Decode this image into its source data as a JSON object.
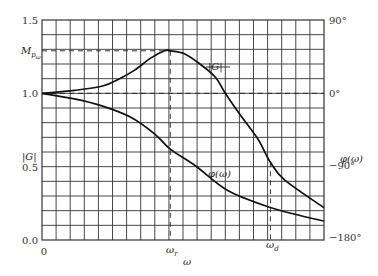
{
  "chart_data": {
    "type": "line",
    "title": "",
    "xlabel": "ω",
    "ylabel_left": "|G|",
    "ylabel_right": "φ(ω)",
    "xlim": [
      0,
      20
    ],
    "ylim_left": [
      0.0,
      1.5
    ],
    "ylim_right": [
      -180,
      90
    ],
    "grid": true,
    "x_ticks": [
      {
        "value": 0,
        "label": "0"
      },
      {
        "value": 9.1,
        "label": "ω_r"
      },
      {
        "value": 16.2,
        "label": "ω_d"
      }
    ],
    "x_tick_labels": {
      "zero": "0",
      "wr": "ω",
      "wr_sub": "r",
      "wd": "ω",
      "wd_sub": "d"
    },
    "y_left_ticks": [
      {
        "value": 0.0,
        "label": "0.0"
      },
      {
        "value": 0.5,
        "label": "0.5"
      },
      {
        "value": 1.0,
        "label": "1.0"
      },
      {
        "value": 1.5,
        "label": "1.5"
      }
    ],
    "mp_label": {
      "main": "M",
      "sub": "p",
      "subsub": "ω",
      "value": 1.29
    },
    "y_right_ticks": [
      {
        "value": 90,
        "label": "90°"
      },
      {
        "value": 0,
        "label": "0°"
      },
      {
        "value": -90,
        "label": "−90°"
      },
      {
        "value": -180,
        "label": "−180°"
      }
    ],
    "series": [
      {
        "name": "|G|",
        "axis": "left",
        "label": "|G|",
        "x": [
          0,
          2.3,
          4.3,
          5.5,
          6.6,
          7.7,
          8.7,
          9.1,
          10.1,
          11.2,
          12.3,
          13.0,
          14.0,
          15.3,
          16.2,
          17.2,
          20.0
        ],
        "y": [
          1.0,
          1.02,
          1.05,
          1.1,
          1.16,
          1.24,
          1.29,
          1.29,
          1.27,
          1.2,
          1.11,
          1.0,
          0.86,
          0.69,
          0.53,
          0.41,
          0.22
        ]
      },
      {
        "name": "φ(ω)",
        "axis": "right",
        "label": "φ(ω)",
        "x": [
          0,
          2.3,
          4.3,
          6.3,
          8.0,
          9.1,
          10.9,
          13.2,
          16.2,
          18.3,
          20.0
        ],
        "y": [
          0,
          -7,
          -16,
          -30,
          -51,
          -70,
          -91,
          -122,
          -143,
          -153,
          -160
        ]
      }
    ],
    "annotations": [
      {
        "type": "hline-dashed",
        "axis": "left",
        "value": 1.0,
        "note": "|G| = 1.0 / φ = 0°"
      },
      {
        "type": "hline-dashed",
        "axis": "left",
        "value": 1.29,
        "note": "M_pω peak level"
      },
      {
        "type": "vline-dashed",
        "x": 9.1,
        "note": "ω_r"
      },
      {
        "type": "vline-dashed",
        "x": 16.2,
        "note": "ω_d"
      }
    ]
  }
}
